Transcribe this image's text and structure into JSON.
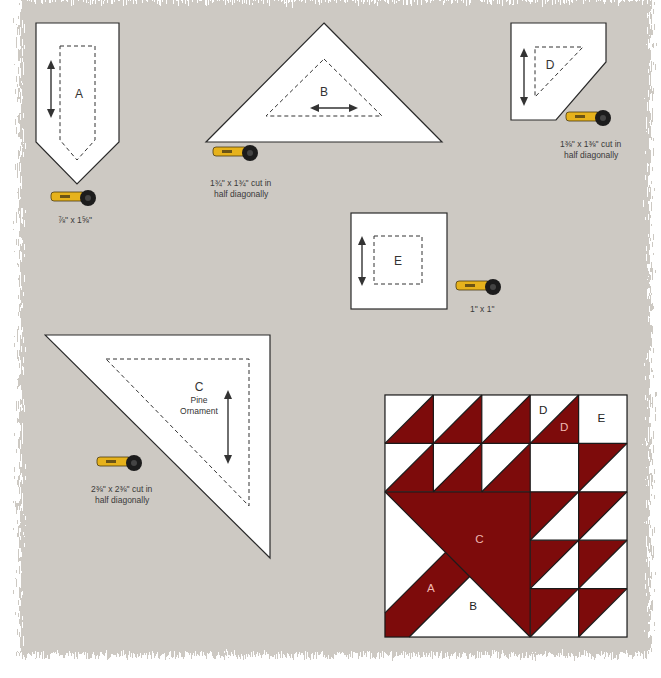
{
  "colors": {
    "background": "#cdc9c3",
    "piece_fill": "#ffffff",
    "outline": "#2a2a2a",
    "quilt_red": "#7d0b0b",
    "quilt_label_on_red": "#f0b8b0",
    "cutter_yellow": "#e6b21c"
  },
  "pieces": {
    "A": {
      "letter": "A",
      "cut_label": "⅞\" x 1⅝\"",
      "grain": "vertical"
    },
    "B": {
      "letter": "B",
      "cut_label_line1": "1¾\" x 1¾\" cut in",
      "cut_label_line2": "half diagonally",
      "grain": "horizontal"
    },
    "C": {
      "letter": "C",
      "name_line1": "Pine",
      "name_line2": "Ornament",
      "cut_label_line1": "2⅜\" x 2⅜\" cut in",
      "cut_label_line2": "half diagonally",
      "grain": "vertical"
    },
    "D": {
      "letter": "D",
      "cut_label_line1": "1⅜\" x 1⅜\" cut in",
      "cut_label_line2": "half diagonally",
      "grain": "vertical"
    },
    "E": {
      "letter": "E",
      "cut_label": "1\" x 1\"",
      "grain": "vertical"
    }
  },
  "icons": [
    "rotary-cutter-icon",
    "grain-arrow-icon"
  ],
  "quilt_block": {
    "grid": "5x5",
    "labels": {
      "A": "A",
      "B": "B",
      "C": "C",
      "D_light": "D",
      "D_dark": "D",
      "E": "E"
    }
  }
}
